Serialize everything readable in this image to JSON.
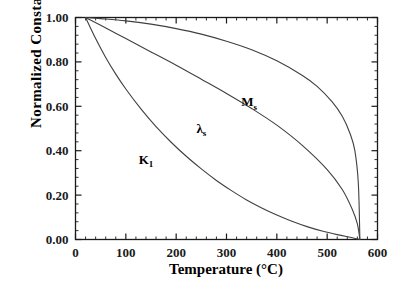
{
  "chart_data": {
    "type": "line",
    "title": "",
    "xlabel": "Temperature  (°C)",
    "ylabel": "Normalized  Constants",
    "xlim": [
      0,
      600
    ],
    "ylim": [
      0.0,
      1.0
    ],
    "xticks": [
      0,
      100,
      200,
      300,
      400,
      500,
      600
    ],
    "xtick_labels": [
      "0",
      "100",
      "200",
      "300",
      "400",
      "500",
      "600"
    ],
    "yticks": [
      0.0,
      0.2,
      0.4,
      0.6,
      0.8,
      1.0
    ],
    "ytick_labels": [
      "0.00",
      "0.20",
      "0.40",
      "0.60",
      "0.80",
      "1.00"
    ],
    "x_minor_interval": 20,
    "y_minor_interval": 0.04,
    "grid": false,
    "legend": "inline-annotations",
    "curie_temperature": 565,
    "line_color": "#404040",
    "series": [
      {
        "name": "M_s",
        "label_text": "M",
        "label_sub": "s",
        "label_x": 345,
        "label_y": 0.6,
        "x": [
          20,
          50,
          100,
          150,
          200,
          250,
          300,
          350,
          400,
          450,
          480,
          510,
          530,
          545,
          555,
          562,
          565
        ],
        "y": [
          1.0,
          0.995,
          0.985,
          0.97,
          0.95,
          0.925,
          0.893,
          0.855,
          0.805,
          0.74,
          0.69,
          0.62,
          0.555,
          0.48,
          0.4,
          0.25,
          0.0
        ]
      },
      {
        "name": "lambda_s",
        "label_text": "λ",
        "label_sub": "s",
        "label_x": 250,
        "label_y": 0.48,
        "x": [
          20,
          50,
          100,
          150,
          200,
          250,
          300,
          350,
          400,
          450,
          500,
          530,
          550,
          560,
          565
        ],
        "y": [
          1.0,
          0.965,
          0.905,
          0.845,
          0.785,
          0.722,
          0.658,
          0.59,
          0.515,
          0.425,
          0.315,
          0.225,
          0.135,
          0.07,
          0.0
        ]
      },
      {
        "name": "K_1",
        "label_text": "K",
        "label_sub": "1",
        "label_x": 140,
        "label_y": 0.34,
        "x": [
          20,
          40,
          60,
          80,
          100,
          130,
          160,
          190,
          220,
          250,
          280,
          310,
          340,
          370,
          400,
          430,
          460,
          490,
          520,
          550,
          565
        ],
        "y": [
          1.0,
          0.905,
          0.82,
          0.745,
          0.678,
          0.588,
          0.508,
          0.438,
          0.375,
          0.318,
          0.266,
          0.22,
          0.178,
          0.142,
          0.11,
          0.082,
          0.058,
          0.038,
          0.022,
          0.008,
          0.0
        ]
      }
    ]
  },
  "figure": {
    "background": "#ffffff",
    "frame_color": "#1a1a1a"
  }
}
